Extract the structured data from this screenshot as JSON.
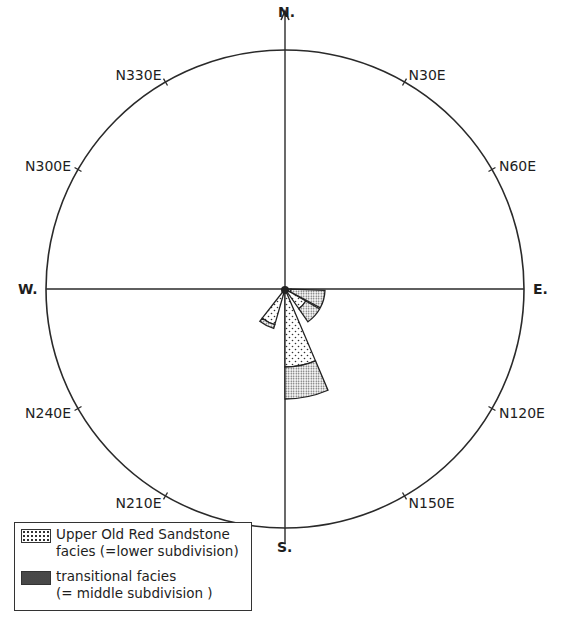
{
  "diagram": {
    "type": "rose-diagram",
    "center": {
      "x": 285,
      "y": 289
    },
    "radius": 239,
    "cardinals": {
      "north": "N.",
      "south": "S.",
      "east": "E.",
      "west": "W."
    },
    "bearing_labels": [
      {
        "text": "N30E",
        "angle": 30
      },
      {
        "text": "N60E",
        "angle": 60
      },
      {
        "text": "N120E",
        "angle": 120
      },
      {
        "text": "N150E",
        "angle": 150
      },
      {
        "text": "N210E",
        "angle": 210
      },
      {
        "text": "N240E",
        "angle": 240
      },
      {
        "text": "N300E",
        "angle": 300
      },
      {
        "text": "N330E",
        "angle": 330
      }
    ],
    "petals": [
      {
        "from": 157,
        "to": 180,
        "lower_r": 78,
        "middle_r": 110
      },
      {
        "from": 120,
        "to": 145,
        "lower_r": 24,
        "middle_r": 40
      },
      {
        "from": 92,
        "to": 118,
        "lower_r": 6,
        "middle_r": 40
      },
      {
        "from": 196,
        "to": 218,
        "lower_r": 37,
        "middle_r": 41
      }
    ]
  },
  "legend": {
    "items": [
      {
        "pattern": "dotted",
        "line1": "Upper Old Red Sandstone",
        "line2": "facies (=lower subdivision)"
      },
      {
        "pattern": "dense-stipple",
        "line1": "transitional facies",
        "line2": "(= middle subdivision )"
      }
    ]
  }
}
